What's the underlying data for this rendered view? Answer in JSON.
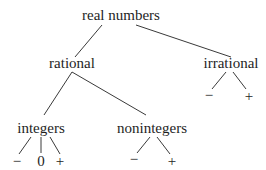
{
  "diagram": {
    "type": "tree",
    "root": {
      "label": "real numbers",
      "children": [
        {
          "label": "rational",
          "children": [
            {
              "label": "integers",
              "children": [
                {
                  "label": "−"
                },
                {
                  "label": "0"
                },
                {
                  "label": "+"
                }
              ]
            },
            {
              "label": "nonintegers",
              "children": [
                {
                  "label": "−"
                },
                {
                  "label": "+"
                }
              ]
            }
          ]
        },
        {
          "label": "irrational",
          "children": [
            {
              "label": "−"
            },
            {
              "label": "+"
            }
          ]
        }
      ]
    }
  },
  "nodes": {
    "real_numbers": "real numbers",
    "rational": "rational",
    "irrational": "irrational",
    "integers": "integers",
    "nonintegers": "nonintegers",
    "irrational_neg": "−",
    "irrational_pos": "+",
    "integers_neg": "−",
    "integers_zero": "0",
    "integers_pos": "+",
    "nonintegers_neg": "−",
    "nonintegers_pos": "+"
  },
  "colors": {
    "line": "#3a3a3a",
    "text": "#1e1e1e",
    "background": "#ffffff"
  }
}
